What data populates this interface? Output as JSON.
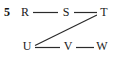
{
  "figure": {
    "number": "5",
    "caption": ""
  },
  "graph": {
    "nodes": [
      {
        "id": "R",
        "label": "R",
        "x": 25,
        "y": 12
      },
      {
        "id": "S",
        "label": "S",
        "x": 66,
        "y": 12
      },
      {
        "id": "T",
        "label": "T",
        "x": 104,
        "y": 12
      },
      {
        "id": "U",
        "label": "U",
        "x": 27,
        "y": 46
      },
      {
        "id": "V",
        "label": "V",
        "x": 68,
        "y": 46
      },
      {
        "id": "W",
        "label": "W",
        "x": 102,
        "y": 46
      }
    ],
    "edges": [
      {
        "from": "R",
        "to": "S",
        "x1": 33,
        "y1": 12,
        "x2": 58,
        "y2": 12
      },
      {
        "from": "S",
        "to": "T",
        "x1": 74,
        "y1": 12,
        "x2": 97,
        "y2": 12
      },
      {
        "from": "U",
        "to": "V",
        "x1": 35,
        "y1": 47,
        "x2": 60,
        "y2": 47
      },
      {
        "from": "V",
        "to": "W",
        "x1": 76,
        "y1": 47,
        "x2": 94,
        "y2": 47
      },
      {
        "from": "U",
        "to": "T",
        "x1": 35,
        "y1": 45,
        "x2": 97,
        "y2": 14
      }
    ],
    "stroke_color": "#2b2b2b",
    "text_color": "#1a1a1a",
    "background_color": "#ffffff"
  }
}
